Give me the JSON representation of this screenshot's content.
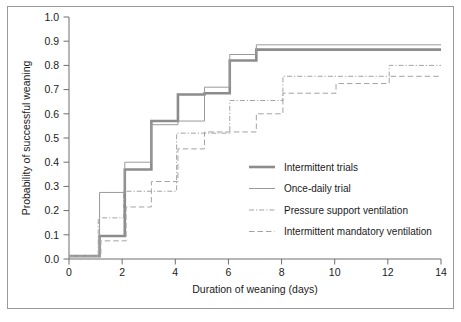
{
  "chart_data": {
    "type": "line",
    "title": "",
    "xlabel": "Duration of weaning (days)",
    "ylabel": "Probability of successful weaning",
    "xlim": [
      0,
      14
    ],
    "ylim": [
      0,
      1.0
    ],
    "xticks": [
      0,
      2,
      4,
      6,
      8,
      10,
      12,
      14
    ],
    "xtick_labels": [
      "0",
      "2",
      "4",
      "6",
      "8",
      "10",
      "12",
      "14"
    ],
    "yticks": [
      0.0,
      0.1,
      0.2,
      0.3,
      0.4,
      0.5,
      0.6,
      0.7,
      0.8,
      0.9,
      1.0
    ],
    "ytick_labels": [
      "0.0",
      "0.1",
      "0.2",
      "0.3",
      "0.4",
      "0.5",
      "0.6",
      "0.7",
      "0.8",
      "0.9",
      "1.0"
    ],
    "grid": false,
    "legend_position": "center-right",
    "step_style": "post",
    "series": [
      {
        "name": "Intermittent trials",
        "style": "solid-thick",
        "color": "#8c8c8c",
        "width": 2.6,
        "x": [
          0,
          1,
          1.15,
          2.1,
          3.1,
          4.1,
          5.1,
          6.05,
          7.05,
          14
        ],
        "y": [
          0.012,
          0.012,
          0.095,
          0.37,
          0.57,
          0.68,
          0.685,
          0.82,
          0.865,
          0.865
        ]
      },
      {
        "name": "Once-daily trial",
        "style": "solid-thin",
        "color": "#9a9a9a",
        "width": 1.0,
        "x": [
          0,
          1,
          1.15,
          2.1,
          3.1,
          4.1,
          5.1,
          6.05,
          7.05,
          14
        ],
        "y": [
          0.012,
          0.012,
          0.275,
          0.4,
          0.555,
          0.57,
          0.71,
          0.845,
          0.885,
          0.885
        ]
      },
      {
        "name": "Pressure support ventilation",
        "style": "dash-dot",
        "color": "#a3a3a3",
        "width": 1.0,
        "x": [
          0,
          1,
          1.1,
          2.05,
          4.05,
          6.05,
          8.05,
          12.05,
          14
        ],
        "y": [
          0.012,
          0.012,
          0.17,
          0.28,
          0.52,
          0.655,
          0.755,
          0.8,
          0.8
        ]
      },
      {
        "name": "Intermittent mandatory ventilation",
        "style": "dashed",
        "color": "#a3a3a3",
        "width": 1.0,
        "x": [
          0,
          1,
          1.2,
          2.15,
          3.1,
          4.1,
          5.1,
          7.05,
          8.05,
          10.05,
          12.05,
          14
        ],
        "y": [
          0.012,
          0.012,
          0.075,
          0.215,
          0.32,
          0.455,
          0.525,
          0.6,
          0.685,
          0.725,
          0.755,
          0.755
        ]
      }
    ]
  },
  "axes": {
    "x_title": "Duration of weaning (days)",
    "y_title": "Probability of successful weaning"
  },
  "legend": {
    "items": [
      {
        "label": "Intermittent trials",
        "swatch": "solid-thick"
      },
      {
        "label": "Once-daily trial",
        "swatch": "solid-thin"
      },
      {
        "label": "Pressure support ventilation",
        "swatch": "dash-dot"
      },
      {
        "label": "Intermittent mandatory ventilation",
        "swatch": "dashed"
      }
    ]
  },
  "colors": {
    "axis": "#6e6e6e",
    "text": "#1a1a1a",
    "border": "#9a9a9a",
    "series_thick": "#8c8c8c",
    "series_thin": "#9a9a9a",
    "series_dash": "#a3a3a3",
    "background": "#ffffff"
  }
}
